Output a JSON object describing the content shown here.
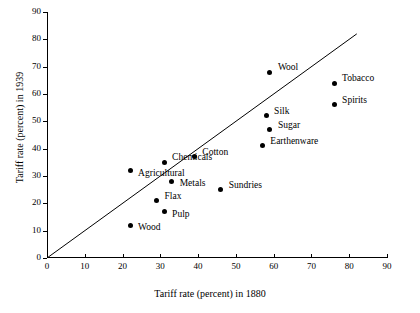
{
  "chart_data": {
    "type": "scatter",
    "title": "",
    "xlabel": "Tariff rate (percent) in 1880",
    "ylabel": "Tariff rate (percent) in 1939",
    "xlim": [
      0,
      90
    ],
    "ylim": [
      0,
      90
    ],
    "xticks": [
      0,
      10,
      20,
      30,
      40,
      50,
      60,
      70,
      80,
      90
    ],
    "yticks": [
      0,
      10,
      20,
      30,
      40,
      50,
      60,
      70,
      80,
      90
    ],
    "grid": false,
    "legend": "none",
    "annotations": [
      {
        "label": "45-degree reference line",
        "type": "line",
        "from": [
          0,
          0
        ],
        "to": [
          82,
          82
        ]
      }
    ],
    "points": [
      {
        "label": "Wool",
        "x": 59,
        "y": 68,
        "label_dx": 8,
        "label_dy": -4
      },
      {
        "label": "Tobacco",
        "x": 76,
        "y": 64,
        "label_dx": 8,
        "label_dy": -4
      },
      {
        "label": "Spirits",
        "x": 76,
        "y": 56,
        "label_dx": 8,
        "label_dy": -4
      },
      {
        "label": "Silk",
        "x": 58,
        "y": 52,
        "label_dx": 8,
        "label_dy": -4
      },
      {
        "label": "Sugar",
        "x": 59,
        "y": 47,
        "label_dx": 8,
        "label_dy": -4
      },
      {
        "label": "Earthenware",
        "x": 57,
        "y": 41,
        "label_dx": 8,
        "label_dy": -4
      },
      {
        "label": "Cotton",
        "x": 39,
        "y": 37,
        "label_dx": 8,
        "label_dy": -4
      },
      {
        "label": "Chemicals",
        "x": 31,
        "y": 35,
        "label_dx": 8,
        "label_dy": -4
      },
      {
        "label": "Agricultural",
        "x": 22,
        "y": 32,
        "label_dx": 8,
        "label_dy": 3
      },
      {
        "label": "Metals",
        "x": 33,
        "y": 28,
        "label_dx": 8,
        "label_dy": 3
      },
      {
        "label": "Sundries",
        "x": 46,
        "y": 25,
        "label_dx": 8,
        "label_dy": -4
      },
      {
        "label": "Flax",
        "x": 29,
        "y": 21,
        "label_dx": 8,
        "label_dy": -4
      },
      {
        "label": "Pulp",
        "x": 31,
        "y": 17,
        "label_dx": 8,
        "label_dy": 3
      },
      {
        "label": "Wood",
        "x": 22,
        "y": 12,
        "label_dx": 8,
        "label_dy": 3
      }
    ]
  }
}
